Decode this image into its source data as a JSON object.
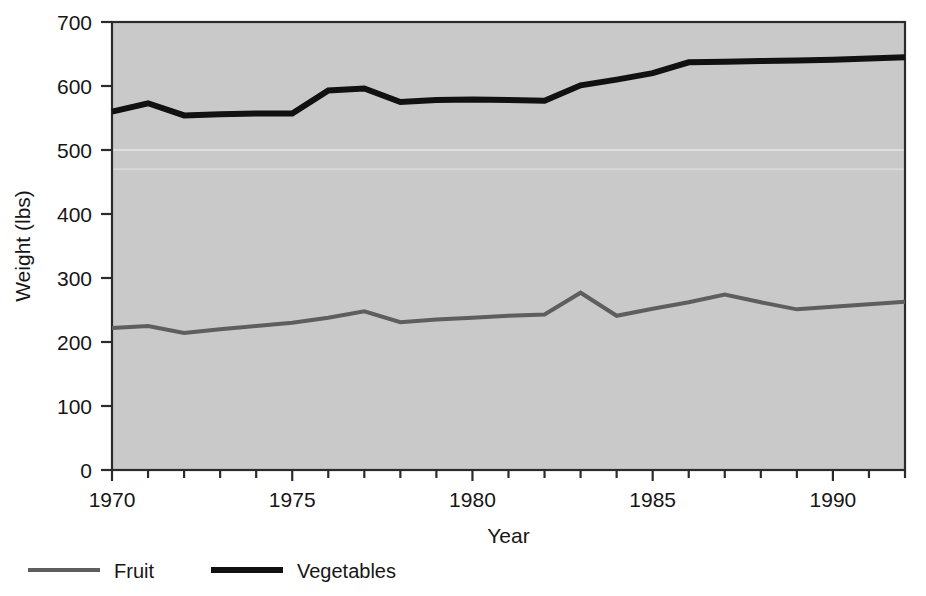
{
  "chart_data": {
    "type": "line",
    "title": "",
    "xlabel": "Year",
    "ylabel": "Weight (lbs)",
    "xlim": [
      1970,
      1992
    ],
    "ylim": [
      0,
      700
    ],
    "ytick_values": [
      0,
      100,
      200,
      300,
      400,
      500,
      600,
      700
    ],
    "ytick_labels": [
      "0",
      "100",
      "200",
      "300",
      "400",
      "500",
      "600",
      "700"
    ],
    "xtick_values": [
      1970,
      1975,
      1980,
      1985,
      1990
    ],
    "xtick_labels": [
      "1970",
      "1975",
      "1980",
      "1985",
      "1990"
    ],
    "x_minor_ticks_every": 1,
    "grid": false,
    "plot_background": "#c9c9c9",
    "legend_position": "below-left",
    "x": [
      1970,
      1971,
      1972,
      1973,
      1974,
      1975,
      1976,
      1977,
      1978,
      1979,
      1980,
      1981,
      1982,
      1983,
      1984,
      1985,
      1986,
      1987,
      1988,
      1989,
      1990,
      1991,
      1992
    ],
    "series": [
      {
        "name": "Fruit",
        "color": "#5e5e5e",
        "line_width": 4,
        "values": [
          222,
          225,
          214,
          220,
          225,
          230,
          238,
          248,
          231,
          235,
          238,
          241,
          243,
          277,
          241,
          252,
          262,
          274,
          262,
          251,
          255,
          259,
          263
        ]
      },
      {
        "name": "Vegetables",
        "color": "#111111",
        "line_width": 6,
        "values": [
          560,
          573,
          554,
          556,
          557,
          557,
          593,
          596,
          575,
          578,
          579,
          578,
          577,
          601,
          610,
          620,
          637,
          638,
          639,
          640,
          641,
          643,
          645
        ]
      }
    ]
  },
  "axes": {
    "y_axis_title": "Weight (lbs)",
    "x_axis_title": "Year"
  },
  "legend": {
    "items": [
      {
        "label": "Fruit",
        "color": "#5e5e5e",
        "line_width": 4
      },
      {
        "label": "Vegetables",
        "color": "#111111",
        "line_width": 6
      }
    ]
  }
}
